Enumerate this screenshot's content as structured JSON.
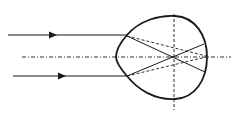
{
  "diagram": {
    "colors": {
      "stroke": "#1a1a1a",
      "background": "#ffffff"
    },
    "incident_rays": [
      {
        "id": "top",
        "x1": 8,
        "y1": 35,
        "x2": 127,
        "y2": 35,
        "arrow_x": 53
      },
      {
        "id": "bottom",
        "x1": 13,
        "y1": 76,
        "x2": 127,
        "y2": 76,
        "arrow_x": 62
      }
    ],
    "optical_axis": {
      "x1": 22,
      "y1": 57,
      "x2": 231,
      "y2": 57,
      "style": "dash-dot"
    },
    "vertical_axis": {
      "x1": 174,
      "y1": 14,
      "x2": 174,
      "y2": 110,
      "style": "dashed"
    },
    "eye_outline": {
      "path": "M 127 35 C 140 20, 160 15, 175 16 C 195 17, 207 35, 207 57 C 207 80, 195 98, 175 99 C 155 100, 138 90, 127 76 C 120 68, 116 62, 116 57 C 116 50, 120 43, 127 35 Z"
    },
    "refracted_rays_solid": [
      {
        "x1": 127,
        "y1": 36,
        "x2": 205,
        "y2": 72
      },
      {
        "x1": 127,
        "y1": 76,
        "x2": 204,
        "y2": 44
      }
    ],
    "refracted_rays_dashed": [
      {
        "x1": 127,
        "y1": 36,
        "x2": 206,
        "y2": 56
      },
      {
        "x1": 127,
        "y1": 76,
        "x2": 206,
        "y2": 57
      }
    ]
  }
}
